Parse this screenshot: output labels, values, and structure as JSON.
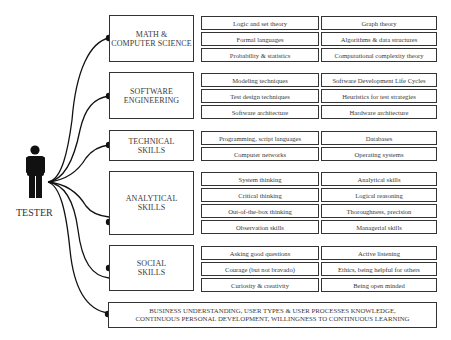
{
  "tester": {
    "label": "TESTER"
  },
  "categories": [
    {
      "title_line1": "MATH &",
      "title_line2": "COMPUTER SCIENCE",
      "skills": [
        [
          "Logic and set theory",
          "Graph theory"
        ],
        [
          "Formal languages",
          "Algorithms & data structures"
        ],
        [
          "Probability & statistics",
          "Computational complexity theory"
        ]
      ]
    },
    {
      "title_line1": "SOFTWARE",
      "title_line2": "ENGINEERING",
      "skills": [
        [
          "Modeling techniques",
          "Software Development Life Cycles"
        ],
        [
          "Test design techniques",
          "Heuristics for test strategies"
        ],
        [
          "Software architecture",
          "Hardware architecture"
        ]
      ]
    },
    {
      "title_line1": "TECHNICAL",
      "title_line2": "SKILLS",
      "skills": [
        [
          "Programming, script languages",
          "Databases"
        ],
        [
          "Computer networks",
          "Operating systems"
        ]
      ]
    },
    {
      "title_line1": "ANALYTICAL",
      "title_line2": "SKILLS",
      "skills": [
        [
          "System thinking",
          "Analytical skills"
        ],
        [
          "Critical thinking",
          "Logical reasoning"
        ],
        [
          "Out-of-the-box thinking",
          "Thoroughness, precision"
        ],
        [
          "Observation skills",
          "Managerial skills"
        ]
      ]
    },
    {
      "title_line1": "SOCIAL",
      "title_line2": "SKILLS",
      "skills": [
        [
          "Asking good questions",
          "Active listening"
        ],
        [
          "Courage (but not bravado)",
          "Ethics, being helpful for others"
        ],
        [
          "Curiosity & creativity",
          "Being open minded"
        ]
      ]
    }
  ],
  "business": {
    "line1": "BUSINESS UNDERSTANDING, USER TYPES & USER PROCESSES KNOWLEDGE,",
    "line2": "CONTINUOUS PERSONAL DEVELOPMENT, WILLINGNESS TO CONTINUOUS LEARNING"
  },
  "colors": {
    "line": "#111111",
    "border": "#333333",
    "text": "#3a3a3a"
  }
}
